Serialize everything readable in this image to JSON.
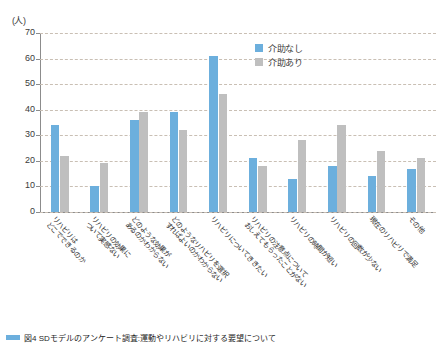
{
  "chart_data": {
    "type": "bar",
    "title": "",
    "unit_label": "(人)",
    "xlabel": "",
    "ylabel": "",
    "ylim": [
      0,
      70
    ],
    "yticks": [
      0,
      10,
      20,
      30,
      40,
      50,
      60,
      70
    ],
    "grid": true,
    "legend_position": "top-right",
    "categories": [
      "リハビリはどこでできるのか",
      "リハビリの効果について実感ない",
      "どのような効果があるのかわからない",
      "どのようなリハビリを選択すればよいのかわからない",
      "リハビリについてききたい",
      "リハビリの注意点についておしえてもらったことがない",
      "リハビリの時間が短い",
      "リハビリの回数が少ない",
      "現在のリハビリで満足",
      "その他"
    ],
    "categories_lines": [
      [
        "リハビリは",
        "どこでできるのか"
      ],
      [
        "リハビリの効果に",
        "ついて実感ない"
      ],
      [
        "どのような効果が",
        "あるのかわからない"
      ],
      [
        "どのようなリハビリを選択",
        "すればよいのかわからない"
      ],
      [
        "リハビリについてききたい"
      ],
      [
        "リハビリの注意点について",
        "おしえてもらったことがない"
      ],
      [
        "リハビリの時間が短い"
      ],
      [
        "リハビリの回数が少ない"
      ],
      [
        "現在のリハビリで満足"
      ],
      [
        "その他"
      ]
    ],
    "series": [
      {
        "name": "介助なし",
        "color": "#6cafdd",
        "values": [
          34,
          10,
          36,
          39,
          61,
          21,
          13,
          18,
          14,
          17
        ]
      },
      {
        "name": "介助あり",
        "color": "#bfbfbf",
        "values": [
          22,
          19,
          39,
          32,
          46,
          18,
          28,
          34,
          24,
          21
        ]
      }
    ]
  },
  "legend": {
    "items": [
      {
        "label": "介助なし",
        "color": "#6cafdd"
      },
      {
        "label": "介助あり",
        "color": "#bfbfbf"
      }
    ]
  },
  "caption": {
    "text": "図4 SDモデルのアンケート調査:運動やリハビリに対する要望について"
  }
}
